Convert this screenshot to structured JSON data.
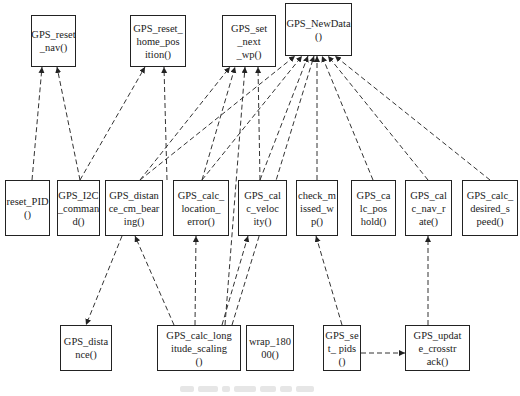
{
  "diagram": {
    "type": "call-graph",
    "nodes": [
      {
        "id": "GPS_reset_nav",
        "label": "GPS_reset\n_nav()",
        "x": 31,
        "y": 15,
        "w": 45,
        "h": 52
      },
      {
        "id": "GPS_reset_home_position",
        "label": "GPS_reset_\nhome_pos\nition()",
        "x": 130,
        "y": 15,
        "w": 56,
        "h": 52
      },
      {
        "id": "GPS_set_next_wp",
        "label": "GPS_set\n_next\n_wp()",
        "x": 222,
        "y": 15,
        "w": 54,
        "h": 52
      },
      {
        "id": "GPS_NewData",
        "label": "GPS_NewData\n()",
        "x": 285,
        "y": 3,
        "w": 67,
        "h": 53
      },
      {
        "id": "reset_PID",
        "label": "reset_PID\n()",
        "x": 5,
        "y": 180,
        "w": 45,
        "h": 56
      },
      {
        "id": "GPS_I2C_command",
        "label": "GPS_I2C\n_comman\nd()",
        "x": 57,
        "y": 180,
        "w": 43,
        "h": 56
      },
      {
        "id": "GPS_distance_cm_bearing",
        "label": "GPS_distan\nce_cm_bear\ning()",
        "x": 105,
        "y": 180,
        "w": 58,
        "h": 56
      },
      {
        "id": "GPS_calc_location_error",
        "label": "GPS_calc_\nlocation_\nerror()",
        "x": 173,
        "y": 180,
        "w": 56,
        "h": 56
      },
      {
        "id": "GPS_calc_velocity",
        "label": "GPS_cal\nc_veloc\nity()",
        "x": 238,
        "y": 180,
        "w": 49,
        "h": 56
      },
      {
        "id": "check_missed_wp",
        "label": "check_m\nissed_w\np()",
        "x": 296,
        "y": 180,
        "w": 42,
        "h": 56
      },
      {
        "id": "GPS_calc_poshold",
        "label": "GPS_ca\nlc_pos\nhold()",
        "x": 351,
        "y": 180,
        "w": 45,
        "h": 56
      },
      {
        "id": "GPS_calc_nav_rate",
        "label": "GPS_cal\nc_nav_r\nate()",
        "x": 405,
        "y": 180,
        "w": 47,
        "h": 56
      },
      {
        "id": "GPS_calc_desired_speed",
        "label": "GPS_calc_\ndesired_s\npeed()",
        "x": 462,
        "y": 180,
        "w": 56,
        "h": 56
      },
      {
        "id": "GPS_distance",
        "label": "GPS_dista\nnce()",
        "x": 60,
        "y": 325,
        "w": 52,
        "h": 46
      },
      {
        "id": "GPS_calc_longitude_scaling",
        "label": "GPS_calc_long\nitude_scaling\n()",
        "x": 157,
        "y": 325,
        "w": 84,
        "h": 46
      },
      {
        "id": "wrap_18000",
        "label": "wrap_180\n00()",
        "x": 246,
        "y": 325,
        "w": 48,
        "h": 46
      },
      {
        "id": "GPS_set_pids",
        "label": "GPS_se\nt_ pids\n()",
        "x": 323,
        "y": 325,
        "w": 38,
        "h": 46
      },
      {
        "id": "GPS_update_crosstrack",
        "label": "GPS_updat\ne_crosstr\nack()",
        "x": 405,
        "y": 325,
        "w": 65,
        "h": 46
      }
    ],
    "edges": [
      {
        "from": "reset_PID",
        "to": "GPS_reset_nav",
        "x1": 32,
        "y1": 180,
        "x2": 42,
        "y2": 67
      },
      {
        "from": "GPS_I2C_command",
        "to": "GPS_reset_nav",
        "x1": 80,
        "y1": 180,
        "x2": 57,
        "y2": 67
      },
      {
        "from": "GPS_I2C_command",
        "to": "GPS_reset_home_position",
        "x1": 80,
        "y1": 180,
        "x2": 145,
        "y2": 67
      },
      {
        "from": "GPS_calc_location_error",
        "to": "GPS_reset_home_position",
        "x1": 167,
        "y1": 180,
        "x2": 164,
        "y2": 67
      },
      {
        "from": "GPS_distance_cm_bearing",
        "to": "GPS_set_next_wp",
        "x1": 140,
        "y1": 180,
        "x2": 230,
        "y2": 67
      },
      {
        "from": "GPS_calc_location_error",
        "to": "GPS_set_next_wp",
        "x1": 202,
        "y1": 180,
        "x2": 235,
        "y2": 67
      },
      {
        "from": "GPS_calc_longitude_scaling",
        "to": "GPS_set_next_wp",
        "x1": 225,
        "y1": 325,
        "x2": 245,
        "y2": 67
      },
      {
        "from": "GPS_calc_velocity",
        "to": "GPS_set_next_wp",
        "x1": 260,
        "y1": 180,
        "x2": 258,
        "y2": 67
      },
      {
        "from": "GPS_distance_cm_bearing",
        "to": "GPS_NewData",
        "x1": 140,
        "y1": 180,
        "x2": 295,
        "y2": 56
      },
      {
        "from": "GPS_calc_location_error",
        "to": "GPS_NewData",
        "x1": 202,
        "y1": 180,
        "x2": 302,
        "y2": 56
      },
      {
        "from": "GPS_calc_velocity",
        "to": "GPS_NewData",
        "x1": 260,
        "y1": 180,
        "x2": 308,
        "y2": 56
      },
      {
        "from": "GPS_calc_longitude_scaling",
        "to": "GPS_NewData",
        "x1": 232,
        "y1": 325,
        "x2": 314,
        "y2": 56
      },
      {
        "from": "check_missed_wp",
        "to": "GPS_NewData",
        "x1": 317,
        "y1": 180,
        "x2": 317,
        "y2": 56
      },
      {
        "from": "GPS_calc_poshold",
        "to": "GPS_NewData",
        "x1": 373,
        "y1": 180,
        "x2": 322,
        "y2": 56
      },
      {
        "from": "GPS_calc_nav_rate",
        "to": "GPS_NewData",
        "x1": 428,
        "y1": 180,
        "x2": 328,
        "y2": 56
      },
      {
        "from": "GPS_calc_desired_speed",
        "to": "GPS_NewData",
        "x1": 490,
        "y1": 180,
        "x2": 335,
        "y2": 56
      },
      {
        "from": "GPS_distance_cm_bearing",
        "to": "GPS_distance",
        "x1": 122,
        "y1": 236,
        "x2": 86,
        "y2": 325
      },
      {
        "from": "GPS_calc_longitude_scaling",
        "to": "GPS_distance_cm_bearing",
        "x1": 174,
        "y1": 325,
        "x2": 135,
        "y2": 236
      },
      {
        "from": "GPS_calc_longitude_scaling",
        "to": "GPS_calc_location_error",
        "x1": 195,
        "y1": 325,
        "x2": 196,
        "y2": 236
      },
      {
        "from": "GPS_calc_longitude_scaling",
        "to": "GPS_calc_velocity",
        "x1": 222,
        "y1": 325,
        "x2": 248,
        "y2": 236
      },
      {
        "from": "GPS_set_pids",
        "to": "check_missed_wp",
        "x1": 342,
        "y1": 325,
        "x2": 316,
        "y2": 236
      },
      {
        "from": "GPS_update_crosstrack",
        "to": "GPS_calc_nav_rate",
        "x1": 428,
        "y1": 325,
        "x2": 428,
        "y2": 236
      },
      {
        "from": "GPS_set_pids",
        "to": "GPS_update_crosstrack",
        "x1": 361,
        "y1": 353,
        "x2": 405,
        "y2": 353
      }
    ],
    "caption_placeholder_widths": [
      14,
      20,
      8,
      22,
      16,
      12,
      18
    ]
  }
}
